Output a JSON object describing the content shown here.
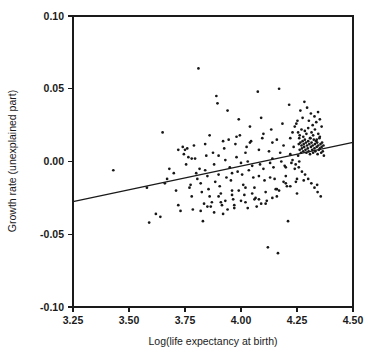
{
  "chart_data": {
    "type": "scatter",
    "title": "",
    "xlabel": "Log(life expectancy at birth)",
    "ylabel": "Growth rate (unexplained part)",
    "xlim": [
      3.25,
      4.5
    ],
    "ylim": [
      -0.1,
      0.1
    ],
    "xticks": [
      3.25,
      3.5,
      3.75,
      4.0,
      4.25,
      4.5
    ],
    "xticklabels": [
      "3.25",
      "3.50",
      "3.75",
      "4.00",
      "4.25",
      "4.50"
    ],
    "yticks": [
      -0.1,
      -0.05,
      0.0,
      0.05,
      0.1
    ],
    "yticklabels": [
      "-0.10",
      "-0.05",
      "0.00",
      "0.05",
      "0.10"
    ],
    "grid": false,
    "legend": false,
    "marker": "small-filled-dot",
    "marker_color": "#171717",
    "n_points": 252,
    "trendline": {
      "type": "linear-fit",
      "x": [
        3.25,
        4.5
      ],
      "y": [
        -0.0275,
        0.0131
      ],
      "slope": 0.0325,
      "intercept": -0.1331,
      "color": "#1a1a1a"
    },
    "x": [
      3.43,
      3.58,
      3.59,
      3.62,
      3.64,
      3.65,
      3.66,
      3.67,
      3.68,
      3.7,
      3.71,
      3.72,
      3.72,
      3.73,
      3.74,
      3.745,
      3.75,
      3.755,
      3.76,
      3.765,
      3.77,
      3.775,
      3.78,
      3.785,
      3.79,
      3.795,
      3.8,
      3.805,
      3.81,
      3.815,
      3.82,
      3.825,
      3.83,
      3.835,
      3.84,
      3.845,
      3.85,
      3.855,
      3.86,
      3.865,
      3.87,
      3.875,
      3.88,
      3.885,
      3.89,
      3.895,
      3.9,
      3.905,
      3.91,
      3.915,
      3.92,
      3.925,
      3.93,
      3.935,
      3.94,
      3.945,
      3.95,
      3.955,
      3.96,
      3.965,
      3.97,
      3.975,
      3.98,
      3.985,
      3.99,
      3.995,
      4.0,
      4.005,
      4.01,
      4.015,
      4.02,
      4.025,
      4.03,
      4.035,
      4.04,
      4.045,
      4.05,
      4.055,
      4.06,
      4.065,
      4.07,
      4.075,
      4.08,
      4.085,
      4.09,
      4.095,
      4.1,
      4.105,
      4.11,
      4.115,
      4.12,
      4.125,
      4.13,
      4.135,
      4.14,
      4.145,
      4.15,
      4.155,
      4.16,
      4.165,
      4.17,
      4.175,
      4.18,
      4.185,
      4.19,
      4.195,
      4.2,
      4.205,
      4.21,
      4.215,
      4.22,
      4.225,
      4.23,
      4.235,
      4.24,
      4.245,
      4.25,
      4.252,
      4.255,
      4.258,
      4.26,
      4.262,
      4.265,
      4.268,
      4.27,
      4.272,
      4.275,
      4.278,
      4.28,
      4.282,
      4.285,
      4.288,
      4.29,
      4.292,
      4.295,
      4.298,
      4.3,
      4.302,
      4.305,
      4.308,
      4.31,
      4.312,
      4.315,
      4.318,
      4.32,
      4.322,
      4.325,
      4.328,
      4.33,
      4.332,
      4.335,
      4.338,
      4.34,
      4.342,
      4.345,
      4.348,
      4.35,
      4.352,
      4.355,
      4.358,
      4.36,
      4.362,
      4.365,
      4.368,
      4.37,
      4.255,
      4.262,
      4.27,
      4.278,
      4.285,
      4.292,
      4.3,
      4.308,
      4.315,
      4.322,
      4.33,
      4.338,
      4.345,
      4.352,
      4.24,
      4.247,
      4.265,
      4.275,
      4.283,
      4.295,
      4.303,
      4.312,
      4.32,
      4.328,
      4.336,
      4.344,
      4.352,
      4.36,
      4.23,
      4.244,
      4.258,
      4.272,
      4.286,
      4.3,
      4.314,
      4.328,
      4.342,
      4.356,
      3.9,
      3.93,
      3.96,
      3.99,
      4.02,
      4.05,
      4.08,
      4.11,
      4.14,
      4.17,
      4.2,
      3.82,
      3.85,
      3.88,
      3.91,
      3.94,
      3.97,
      4.0,
      4.03,
      4.06,
      4.09,
      3.78,
      3.84,
      3.9,
      3.96,
      4.02,
      4.08,
      4.14,
      4.2,
      4.26,
      3.86,
      3.92,
      3.98,
      4.04,
      4.1,
      4.16,
      4.22,
      4.28,
      4.34,
      4.13,
      4.16,
      4.19,
      4.22,
      4.25,
      4.28,
      4.31
    ],
    "y": [
      -0.006,
      -0.018,
      -0.042,
      -0.036,
      -0.038,
      0.02,
      -0.015,
      -0.012,
      -0.005,
      -0.008,
      -0.02,
      0.008,
      -0.03,
      -0.034,
      0.01,
      0.005,
      0.008,
      -0.002,
      0.009,
      0.003,
      -0.018,
      -0.016,
      -0.024,
      -0.033,
      0.011,
      0.002,
      -0.008,
      -0.012,
      0.064,
      -0.005,
      -0.015,
      -0.021,
      -0.041,
      -0.029,
      0.012,
      0.004,
      -0.01,
      -0.019,
      -0.024,
      -0.031,
      -0.028,
      0.006,
      -0.002,
      -0.014,
      0.045,
      0.04,
      -0.009,
      -0.017,
      -0.022,
      -0.03,
      -0.036,
      0.009,
      0.001,
      -0.011,
      0.035,
      0.015,
      -0.004,
      -0.013,
      -0.02,
      -0.026,
      -0.032,
      0.012,
      0.003,
      -0.007,
      0.029,
      0.018,
      -0.001,
      -0.009,
      -0.016,
      -0.023,
      -0.028,
      0.01,
      0.0,
      -0.006,
      0.024,
      0.014,
      -0.003,
      -0.011,
      -0.018,
      -0.025,
      -0.031,
      0.048,
      0.008,
      -0.002,
      0.03,
      0.016,
      -0.005,
      -0.013,
      -0.021,
      -0.027,
      -0.059,
      0.007,
      -0.001,
      0.022,
      0.013,
      -0.004,
      -0.012,
      -0.019,
      -0.024,
      -0.063,
      0.05,
      0.006,
      0.0,
      0.026,
      0.011,
      -0.003,
      -0.01,
      -0.017,
      -0.041,
      0.039,
      0.005,
      -0.001,
      0.02,
      0.01,
      -0.005,
      -0.014,
      -0.022,
      0.028,
      0.004,
      0.012,
      0.016,
      0.008,
      0.013,
      0.006,
      0.011,
      0.009,
      0.014,
      0.007,
      0.012,
      0.01,
      0.015,
      0.008,
      0.013,
      0.006,
      0.011,
      0.009,
      0.014,
      0.007,
      0.012,
      0.005,
      0.016,
      0.01,
      0.013,
      0.008,
      0.011,
      0.006,
      0.015,
      0.009,
      0.012,
      0.007,
      0.014,
      0.01,
      0.013,
      0.005,
      0.011,
      0.008,
      0.016,
      0.009,
      0.012,
      0.006,
      0.01,
      0.013,
      0.007,
      0.011,
      0.004,
      0.02,
      0.018,
      0.022,
      0.017,
      0.021,
      0.019,
      0.023,
      0.016,
      0.02,
      0.018,
      0.022,
      0.015,
      0.019,
      0.017,
      0.024,
      0.026,
      0.035,
      0.03,
      0.041,
      0.037,
      0.028,
      0.033,
      0.025,
      0.031,
      0.027,
      0.034,
      0.029,
      0.024,
      0.001,
      -0.002,
      -0.004,
      -0.007,
      -0.009,
      -0.012,
      -0.015,
      -0.018,
      -0.021,
      -0.024,
      -0.024,
      -0.027,
      -0.023,
      -0.02,
      -0.018,
      -0.022,
      -0.026,
      -0.029,
      -0.025,
      -0.02,
      -0.015,
      -0.034,
      -0.031,
      -0.035,
      -0.028,
      -0.033,
      -0.03,
      -0.027,
      -0.032,
      -0.026,
      -0.029,
      0.002,
      -0.006,
      0.004,
      -0.008,
      0.006,
      -0.01,
      0.002,
      -0.004,
      0.0,
      0.018,
      0.014,
      0.017,
      0.013,
      0.019,
      0.015,
      0.016,
      -0.013,
      -0.016,
      -0.011,
      -0.019,
      -0.014,
      -0.017,
      -0.012
    ]
  }
}
